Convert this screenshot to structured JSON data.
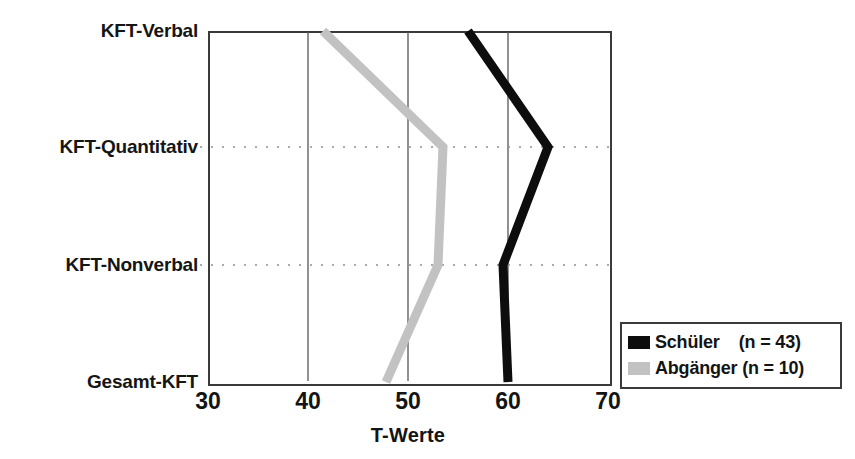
{
  "chart_data": {
    "type": "line",
    "title": "",
    "orientation": "horizontal",
    "xlabel": "T-Werte",
    "ylabel": "",
    "xlim": [
      30,
      70
    ],
    "xticks": [
      30,
      40,
      50,
      60,
      70
    ],
    "xtick_labels": [
      "30",
      "40",
      "50",
      "60",
      "70"
    ],
    "categories": [
      "KFT-Verbal",
      "KFT-Quantitativ",
      "KFT-Nonverbal",
      "Gesamt-KFT"
    ],
    "grid": {
      "vertical": true,
      "vertical_style": "solid-thin",
      "horizontal": true,
      "horizontal_style": "dotted"
    },
    "legend_position": "bottom-right",
    "series": [
      {
        "name": "Schüler",
        "n_label": "(n = 43)",
        "color": "#0d0d0d",
        "values": [
          56.0,
          64.0,
          59.5,
          60.0
        ]
      },
      {
        "name": "Abgänger",
        "n_label": "(n = 10)",
        "color": "#c2c2c2",
        "values": [
          41.5,
          53.5,
          53.0,
          47.8
        ]
      }
    ]
  },
  "axes": {
    "y_categories": [
      {
        "label": "KFT-Verbal"
      },
      {
        "label": "KFT-Quantitativ"
      },
      {
        "label": "KFT-Nonverbal"
      },
      {
        "label": "Gesamt-KFT"
      }
    ],
    "x_ticks": [
      {
        "label": "30"
      },
      {
        "label": "40"
      },
      {
        "label": "50"
      },
      {
        "label": "60"
      },
      {
        "label": "70"
      }
    ],
    "x_title": "T-Werte"
  },
  "legend": {
    "entries": [
      {
        "label": "Schüler",
        "count": "(n = 43)",
        "display": "Schüler    (n = 43)",
        "color": "#0d0d0d"
      },
      {
        "label": "Abgänger",
        "count": "(n = 10)",
        "display": "Abgänger (n = 10)",
        "color": "#c2c2c2"
      }
    ]
  },
  "colors": {
    "frame": "#3a3a3a",
    "gridline": "#555555",
    "dotted": "#8a8a8a",
    "schueler": "#0d0d0d",
    "abgaenger": "#c2c2c2",
    "text": "#141414"
  }
}
